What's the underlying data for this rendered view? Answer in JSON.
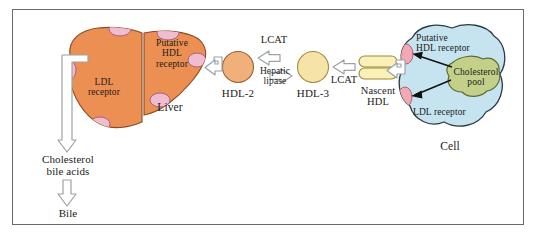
{
  "figure": {
    "background": "#ffffff",
    "frame_color": "#6a6a6a"
  },
  "colors": {
    "liver_fill": "#ec8f52",
    "liver_stroke": "#8a4a22",
    "receptor_pink": "#f0bcd0",
    "receptor_pink_stroke": "#a8607f",
    "cell_fill": "#c6e4ef",
    "cell_stroke": "#2c3a46",
    "cholesterol_pool_fill": "#c3d08a",
    "cholesterol_pool_stroke": "#5d6b33",
    "cell_receptor_fill": "#f2a9b4",
    "cell_receptor_stroke": "#b06070",
    "hdl2_fill": "#f0b07a",
    "hdl2_stroke": "#9a5f30",
    "hdl3_fill": "#f5e3a8",
    "hdl3_stroke": "#a08c3c",
    "nascent_fill": "#faf0b8",
    "nascent_stroke": "#9a8b35",
    "arrow_fill": "#ffffff",
    "arrow_stroke": "#9aa2a6",
    "text": "#1b1b1b"
  },
  "organs": {
    "liver": {
      "label": "Liver",
      "receptors": [
        {
          "name": "LDL receptor",
          "label": "LDL\nreceptor"
        },
        {
          "name": "Putative HDL receptor",
          "label": "Putative\nHDL\nreceptor"
        }
      ]
    },
    "cell": {
      "label": "Cell",
      "receptors": [
        {
          "name": "Putative HDL receptor",
          "label": "Putative\nHDL receptor"
        },
        {
          "name": "LDL receptor",
          "label": "LDL receptor"
        }
      ],
      "cholesterol_pool": {
        "label": "Cholesterol\npool"
      }
    }
  },
  "particles": [
    {
      "id": "hdl2",
      "label": "HDL-2",
      "shape": "circle"
    },
    {
      "id": "hdl3",
      "label": "HDL-3",
      "shape": "circle"
    },
    {
      "id": "nascent_hdl",
      "label": "Nascent\nHDL",
      "shape": "disc-stack"
    }
  ],
  "enzymes": {
    "lcat_upper": "LCAT",
    "hepatic_lipase": "Hepatic\nlipase",
    "lcat_right": "LCAT"
  },
  "excretion": {
    "cholesterol_bile_acids": "Cholesterol\nbile acids",
    "bile": "Bile"
  },
  "arrows": [
    {
      "name": "nascent-hdl-to-cell-hook",
      "type": "hooked"
    },
    {
      "name": "nascent-hdl-to-hdl3",
      "type": "block-left"
    },
    {
      "name": "hdl3-to-hdl2-lcat",
      "type": "block-left"
    },
    {
      "name": "hdl2-to-hdl3-hepatic-lipase",
      "type": "block-right"
    },
    {
      "name": "hdl2-to-liver-hook",
      "type": "hooked"
    },
    {
      "name": "liver-to-cholesterol-bile-acids",
      "type": "hooked-long"
    },
    {
      "name": "cholesterol-bile-acids-to-bile",
      "type": "block-down"
    },
    {
      "name": "cholesterol-pool-to-hdl-receptor",
      "type": "thin-line"
    },
    {
      "name": "cholesterol-pool-to-ldl-receptor",
      "type": "thin-line"
    }
  ]
}
